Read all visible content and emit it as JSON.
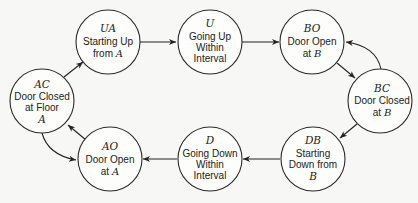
{
  "diagram": {
    "type": "state-transition",
    "nodes": [
      {
        "id": "UA",
        "code": "UA",
        "lines": [
          "Starting Up",
          "from A"
        ],
        "cx": 108,
        "cy": 42
      },
      {
        "id": "U",
        "code": "U",
        "lines": [
          "Going Up",
          "Within",
          "Interval"
        ],
        "cx": 210,
        "cy": 42
      },
      {
        "id": "BO",
        "code": "BO",
        "lines": [
          "Door Open",
          "at B"
        ],
        "cx": 312,
        "cy": 42
      },
      {
        "id": "BC",
        "code": "BC",
        "lines": [
          "Door Closed",
          "at B"
        ],
        "cx": 380,
        "cy": 101
      },
      {
        "id": "DB",
        "code": "DB",
        "lines": [
          "Starting",
          "Down from",
          "B"
        ],
        "cx": 313,
        "cy": 159
      },
      {
        "id": "D",
        "code": "D",
        "lines": [
          "Going Down",
          "Within",
          "Interval"
        ],
        "cx": 210,
        "cy": 159
      },
      {
        "id": "AO",
        "code": "AO",
        "lines": [
          "Door Open",
          "at A"
        ],
        "cx": 110,
        "cy": 159
      },
      {
        "id": "AC",
        "code": "AC",
        "lines": [
          "Door Closed",
          "at Floor",
          "A"
        ],
        "cx": 42,
        "cy": 101
      }
    ],
    "edges": [
      {
        "from": "AC",
        "to": "UA"
      },
      {
        "from": "UA",
        "to": "U"
      },
      {
        "from": "U",
        "to": "BO"
      },
      {
        "from": "BO",
        "to": "BC"
      },
      {
        "from": "BC",
        "to": "BO",
        "curved": true
      },
      {
        "from": "BC",
        "to": "DB"
      },
      {
        "from": "DB",
        "to": "D"
      },
      {
        "from": "D",
        "to": "AO"
      },
      {
        "from": "AO",
        "to": "AC"
      },
      {
        "from": "AC",
        "to": "AO",
        "curved": true
      }
    ]
  },
  "labels": {
    "UA": {
      "code": "UA",
      "l1": "Starting Up",
      "l2a": "from ",
      "l2b": "A"
    },
    "U": {
      "code": "U",
      "l1": "Going Up",
      "l2": "Within",
      "l3": "Interval"
    },
    "BO": {
      "code": "BO",
      "l1": "Door Open",
      "l2a": "at ",
      "l2b": "B"
    },
    "BC": {
      "code": "BC",
      "l1": "Door Closed",
      "l2a": "at ",
      "l2b": "B"
    },
    "DB": {
      "code": "DB",
      "l1": "Starting",
      "l2": "Down from",
      "l3": "B"
    },
    "D": {
      "code": "D",
      "l1": "Going Down",
      "l2": "Within",
      "l3": "Interval"
    },
    "AO": {
      "code": "AO",
      "l1": "Door Open",
      "l2a": "at ",
      "l2b": "A"
    },
    "AC": {
      "code": "AC",
      "l1": "Door Closed",
      "l2": "at Floor",
      "l3": "A"
    }
  }
}
